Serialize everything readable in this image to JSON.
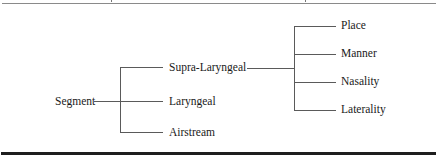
{
  "diagram": {
    "type": "tree",
    "orientation": "left-to-right",
    "root": {
      "label": "Segment",
      "children": [
        {
          "label": "Supra-Laryngeal",
          "children": [
            {
              "label": "Place"
            },
            {
              "label": "Manner"
            },
            {
              "label": "Nasality"
            },
            {
              "label": "Laterality"
            }
          ]
        },
        {
          "label": "Laryngeal"
        },
        {
          "label": "Airstream"
        }
      ]
    },
    "nodes": {
      "segment": "Segment",
      "supra_laryngeal": "Supra-Laryngeal",
      "laryngeal": "Laryngeal",
      "airstream": "Airstream",
      "place": "Place",
      "manner": "Manner",
      "nasality": "Nasality",
      "laterality": "Laterality"
    },
    "colors": {
      "line": "#5a5a5a",
      "text": "#1a1a1a",
      "bottom_rule": "#1e1e1e",
      "top_rule": "#8a8a8a"
    }
  }
}
